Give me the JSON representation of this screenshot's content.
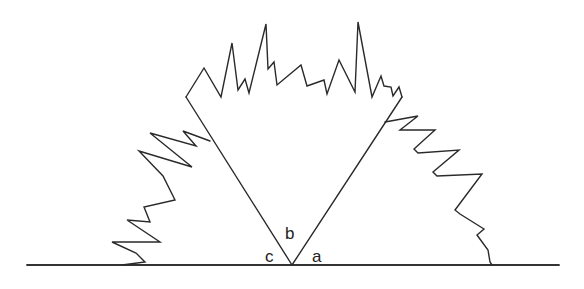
{
  "diagram": {
    "stroke_color": "#2a2a2a",
    "background": "#ffffff",
    "labels": {
      "a": "a",
      "b": "b",
      "c": "c"
    },
    "geometry": {
      "baseline": {
        "x1": 27,
        "y1": 265,
        "x2": 559,
        "y2": 265
      },
      "vertex": {
        "x": 292,
        "y": 265
      },
      "left_arm_top": {
        "x": 186,
        "y": 97
      },
      "right_arm_top": {
        "x": 402,
        "y": 97
      }
    }
  }
}
